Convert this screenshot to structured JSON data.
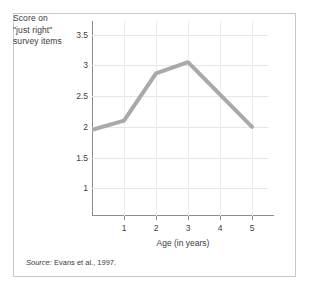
{
  "figure": {
    "y_axis_caption_lines": [
      "Score on",
      "\"just right\"",
      "survey items"
    ],
    "x_axis_title": "Age (in years)",
    "source_prefix": "Source:",
    "source_text": "Evans et al., 1997."
  },
  "colors": {
    "line": "#a9a9a9",
    "grid": "#e6e6e6",
    "axis": "#8c8c8c",
    "text": "#3a3a3a",
    "border": "#c8c8c8",
    "background": "#ffffff"
  },
  "chart_data": {
    "type": "line",
    "title": "",
    "xlabel": "Age (in years)",
    "ylabel": "Score on \"just right\" survey items",
    "xlim": [
      0,
      5.5
    ],
    "ylim": [
      0.55,
      3.72
    ],
    "xticks": [
      1,
      2,
      3,
      4,
      5
    ],
    "xtick_labels": [
      "1",
      "2",
      "3",
      "4",
      "5"
    ],
    "yticks": [
      1,
      1.5,
      2,
      2.5,
      3,
      3.5
    ],
    "ytick_labels": [
      "1",
      "1.5",
      "2",
      "2.5",
      "3",
      "3.5"
    ],
    "grid": true,
    "legend": false,
    "series": [
      {
        "name": "Score on \"just right\" survey items",
        "color": "#a9a9a9",
        "linewidth": 4,
        "x": [
          0,
          1,
          2,
          3,
          5
        ],
        "values": [
          1.95,
          2.1,
          2.87,
          3.05,
          2.0
        ]
      }
    ],
    "annotations": [
      "Source: Evans et al., 1997."
    ]
  }
}
